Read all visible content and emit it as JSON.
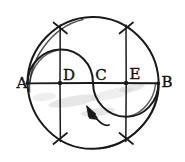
{
  "figure": {
    "kind": "hand-drawn-geometry-sketch",
    "background_color": "#ffffff",
    "ink_color": "#1a1a1a",
    "width": 185,
    "height": 162
  },
  "labels": {
    "a": "A",
    "b": "B",
    "c": "C",
    "d": "D",
    "e": "E"
  },
  "points": {
    "a": {
      "name": "A",
      "x": 27,
      "y": 83,
      "label_x": 22,
      "label_y": 82
    },
    "d": {
      "name": "D",
      "x": 60,
      "y": 83,
      "label_x": 68,
      "label_y": 80
    },
    "c": {
      "name": "C",
      "x": 93,
      "y": 83,
      "label_x": 100,
      "label_y": 80
    },
    "e": {
      "name": "E",
      "x": 126,
      "y": 83,
      "label_x": 126,
      "label_y": 79
    },
    "b": {
      "name": "B",
      "x": 158,
      "y": 83,
      "label_x": 166,
      "label_y": 82
    }
  },
  "geometry": {
    "main_circle": {
      "cx": 93,
      "cy": 83,
      "r": 66
    },
    "diameter_line": {
      "x1": 27,
      "y1": 83,
      "x2": 158,
      "y2": 83
    },
    "chord_left": {
      "x": 60,
      "y_top": 26,
      "y_bottom": 140
    },
    "chord_right": {
      "x": 126,
      "y_top": 26,
      "y_bottom": 140
    },
    "semicircle_upper": {
      "from": "A",
      "to": "C",
      "center": "D",
      "r": 33,
      "bulge": "up"
    },
    "semicircle_lower": {
      "from": "C",
      "to": "B",
      "center": "E",
      "r": 33,
      "bulge": "down"
    }
  },
  "annotations": {
    "arrow": {
      "name": "pointer-arrow",
      "tip_x": 89,
      "tip_y": 110,
      "tail_x": 106,
      "tail_y": 126,
      "direction": "up-left"
    },
    "tick_marks": [
      {
        "name": "tick-top-left",
        "x": 60,
        "y": 26
      },
      {
        "name": "tick-top-right",
        "x": 126,
        "y": 26
      },
      {
        "name": "tick-bottom-left",
        "x": 60,
        "y": 140
      },
      {
        "name": "tick-bottom-right",
        "x": 126,
        "y": 140
      }
    ]
  }
}
